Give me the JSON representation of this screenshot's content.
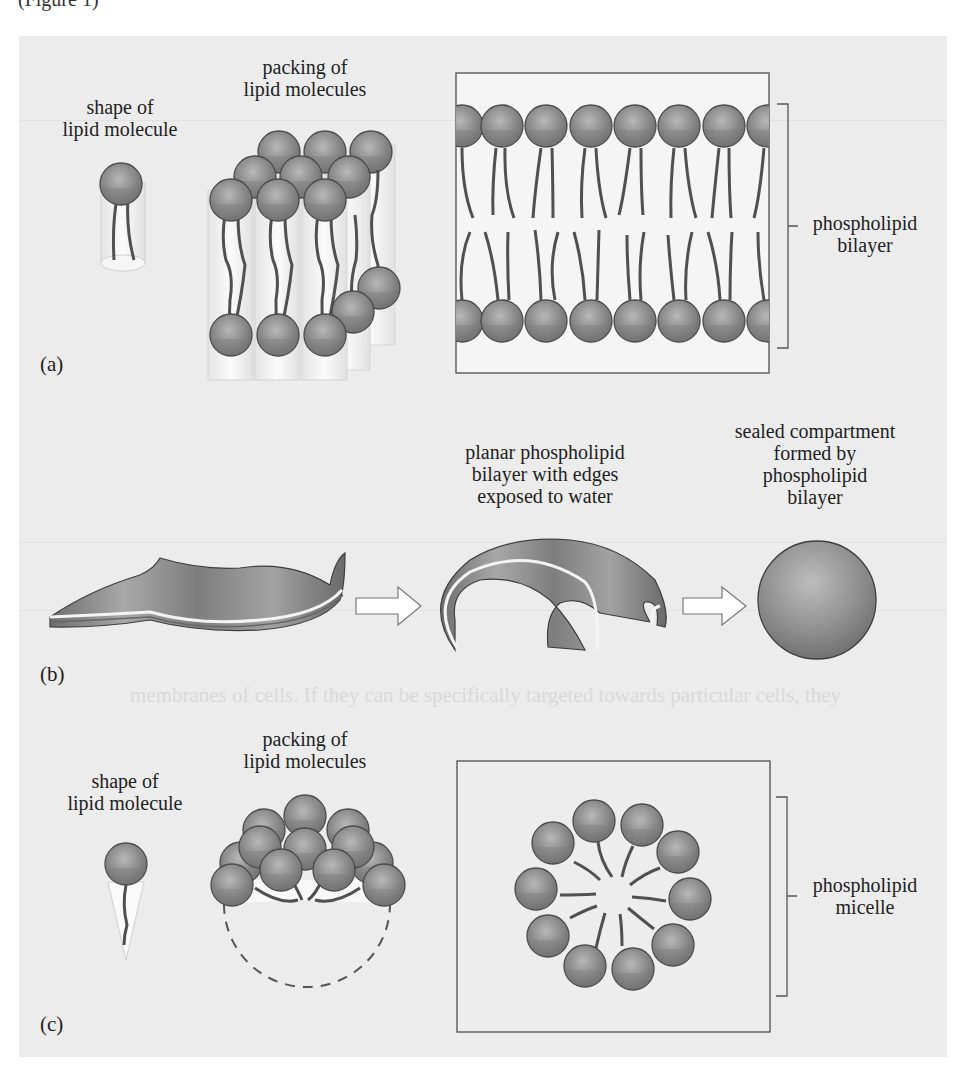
{
  "page": {
    "top_fragment": "(Figure 1)",
    "bleed_through_text": "membranes of cells. If they can be specifically targeted towards particular cells, they"
  },
  "part_a": {
    "label": "(a)",
    "shape_label": [
      "shape of",
      "lipid molecule"
    ],
    "packing_label": [
      "packing of",
      "lipid molecules"
    ],
    "structure_label": [
      "phospholipid",
      "bilayer"
    ]
  },
  "part_b": {
    "label": "(b)",
    "planar_label": [
      "planar phospholipid",
      "bilayer with edges",
      "exposed to water"
    ],
    "sealed_label": [
      "sealed compartment",
      "formed by",
      "phospholipid",
      "bilayer"
    ]
  },
  "part_c": {
    "label": "(c)",
    "shape_label": [
      "shape of",
      "lipid molecule"
    ],
    "packing_label": [
      "packing of",
      "lipid molecules"
    ],
    "structure_label": [
      "phospholipid",
      "micelle"
    ]
  },
  "colors": {
    "panel_bg": "#ececec",
    "box_bg": "#f4f4f4",
    "head_fill": "#8a8a8a",
    "head_highlight": "#b4b4b4",
    "head_stroke": "#4a4a4a",
    "tail": "#505050",
    "outline": "#555555"
  }
}
